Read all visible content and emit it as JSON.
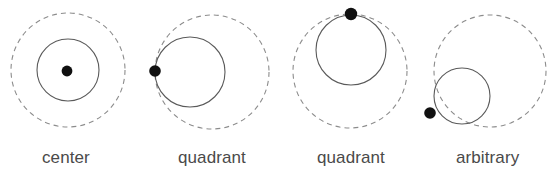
{
  "figure": {
    "background_color": "#ffffff",
    "width": 549,
    "height": 178
  },
  "style": {
    "dashed_circle_color": "#8c8c8c",
    "dashed_circle_stroke_width": 1.1,
    "dashed_pattern": "5,4",
    "solid_circle_color": "#5a5a5a",
    "solid_circle_stroke_width": 1.1,
    "dot_color": "#101010",
    "label_color": "#4a4a4a",
    "label_font_size": "17px"
  },
  "panels": [
    {
      "id": "panel-center",
      "label": "center",
      "label_x": 42,
      "label_y": 149,
      "reference_circle": {
        "cx": 68,
        "cy": 70,
        "r": 57,
        "style": "dashed"
      },
      "inner_circle": {
        "cx": 68,
        "cy": 70,
        "r": 31,
        "style": "solid"
      },
      "dot": {
        "cx": 67,
        "cy": 71,
        "r": 5.4
      },
      "placement": "center"
    },
    {
      "id": "panel-quadrant-left",
      "label": "quadrant",
      "label_x": 178,
      "label_y": 149,
      "reference_circle": {
        "cx": 212,
        "cy": 72,
        "r": 57,
        "style": "dashed"
      },
      "inner_circle": {
        "cx": 190,
        "cy": 72,
        "r": 35,
        "style": "solid"
      },
      "dot": {
        "cx": 155,
        "cy": 71,
        "r": 5.8
      },
      "placement": "quadrant-left"
    },
    {
      "id": "panel-quadrant-top",
      "label": "quadrant",
      "label_x": 317,
      "label_y": 149,
      "reference_circle": {
        "cx": 350,
        "cy": 71,
        "r": 57,
        "style": "dashed"
      },
      "inner_circle": {
        "cx": 351,
        "cy": 50,
        "r": 35,
        "style": "solid"
      },
      "dot": {
        "cx": 351,
        "cy": 14,
        "r": 6.2
      },
      "placement": "quadrant-top"
    },
    {
      "id": "panel-arbitrary",
      "label": "arbitrary",
      "label_x": 456,
      "label_y": 149,
      "reference_circle": {
        "cx": 490,
        "cy": 71,
        "r": 56,
        "style": "dashed"
      },
      "inner_circle": {
        "cx": 462,
        "cy": 96,
        "r": 28,
        "style": "solid"
      },
      "dot": {
        "cx": 430,
        "cy": 113,
        "r": 5.8
      },
      "placement": "arbitrary"
    }
  ]
}
